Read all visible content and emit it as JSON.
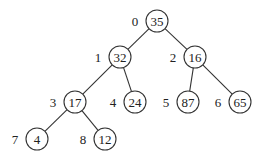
{
  "diagram": {
    "type": "binary-heap-tree",
    "colors": {
      "stroke": "#333333",
      "text": "#222222",
      "background": "#ffffff"
    },
    "nodes": [
      {
        "index": "0",
        "value": "35",
        "cx": 157,
        "cy": 21
      },
      {
        "index": "1",
        "value": "32",
        "cx": 120,
        "cy": 57
      },
      {
        "index": "2",
        "value": "16",
        "cx": 195,
        "cy": 57
      },
      {
        "index": "3",
        "value": "17",
        "cx": 75,
        "cy": 102
      },
      {
        "index": "4",
        "value": "24",
        "cx": 135,
        "cy": 102
      },
      {
        "index": "5",
        "value": "87",
        "cx": 188,
        "cy": 102
      },
      {
        "index": "6",
        "value": "65",
        "cx": 240,
        "cy": 102
      },
      {
        "index": "7",
        "value": "4",
        "cx": 37,
        "cy": 139
      },
      {
        "index": "8",
        "value": "12",
        "cx": 105,
        "cy": 139
      }
    ],
    "edges": [
      [
        "0",
        "1"
      ],
      [
        "0",
        "2"
      ],
      [
        "1",
        "3"
      ],
      [
        "1",
        "4"
      ],
      [
        "2",
        "5"
      ],
      [
        "2",
        "6"
      ],
      [
        "3",
        "7"
      ],
      [
        "3",
        "8"
      ]
    ]
  }
}
